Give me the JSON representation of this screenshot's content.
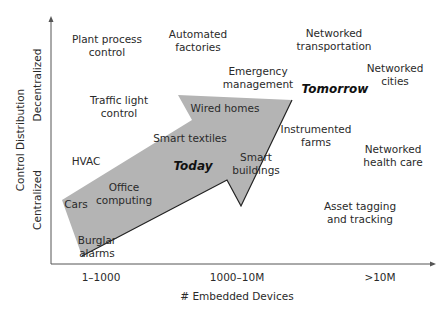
{
  "axes": {
    "x_title": "# Embedded Devices",
    "x_ticks": [
      "1–1000",
      "1000–10M",
      ">10M"
    ],
    "y_title": "Control Distribution",
    "y_ticks": [
      "Centralized",
      "Decentralized"
    ]
  },
  "eras": {
    "today": "Today",
    "tomorrow": "Tomorrow"
  },
  "applications": [
    {
      "line1": "Plant process",
      "line2": "control"
    },
    {
      "line1": "Automated",
      "line2": "factories"
    },
    {
      "line1": "Networked",
      "line2": "transportation"
    },
    {
      "line1": "Emergency",
      "line2": "management"
    },
    {
      "line1": "Networked",
      "line2": "cities"
    },
    {
      "line1": "Traffic light",
      "line2": "control"
    },
    {
      "line1": "Wired homes",
      "line2": ""
    },
    {
      "line1": "Smart textiles",
      "line2": ""
    },
    {
      "line1": "Instrumented",
      "line2": "farms"
    },
    {
      "line1": "HVAC",
      "line2": ""
    },
    {
      "line1": "Smart",
      "line2": "buildings"
    },
    {
      "line1": "Networked",
      "line2": "health care"
    },
    {
      "line1": "Office",
      "line2": "computing"
    },
    {
      "line1": "Cars",
      "line2": ""
    },
    {
      "line1": "Asset tagging",
      "line2": "and tracking"
    },
    {
      "line1": "Burglar",
      "line2": "alarms"
    }
  ],
  "colors": {
    "arrow_fill": "#b4b4b4",
    "arrow_edge": "#222222",
    "axis": "#555555",
    "text": "#2a2a2a"
  }
}
